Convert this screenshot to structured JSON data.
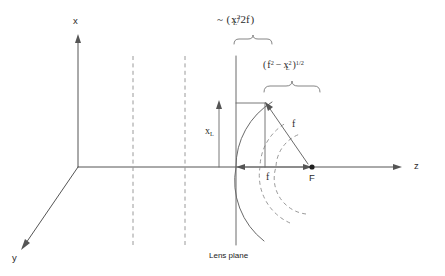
{
  "figure": {
    "background_color": "#ffffff",
    "line_color": "#555555",
    "dashed_color": "#9a9a9a"
  },
  "axes": {
    "x_label": "x",
    "y_label": "y",
    "z_label": "z",
    "origin_label": ""
  },
  "labels": {
    "lens_plane": "Lens plane",
    "focal_point": "F",
    "x_l_symbol": "x",
    "x_l_subscript": "L",
    "focal_length_axis": "f",
    "focal_length_ray": "f"
  },
  "annotations": {
    "top_formula": {
      "tilde": "~",
      "open_paren": "(",
      "numerator_base": "x",
      "numerator_sub": "L",
      "numerator_sup": "2",
      "slash": "/",
      "denominator": "2f",
      "close_paren": ")",
      "plain_text": "~ ( x_L^2 / 2f )"
    },
    "right_formula": {
      "open_paren": "(",
      "term1_base": "f",
      "term1_sup": "2",
      "minus": "−",
      "term2_base": "x",
      "term2_sub": "L",
      "term2_sup": "2",
      "close_paren": ")",
      "exponent": "1/2",
      "plain_text": "( f^2 - x_L^2 )^(1/2)"
    }
  },
  "geometry": {
    "origin": {
      "x": 78,
      "y": 167
    },
    "z_axis_end": {
      "x": 400,
      "y": 167
    },
    "x_axis_top": {
      "x": 78,
      "y": 34
    },
    "y_axis_end": {
      "x": 20,
      "y": 248
    },
    "lens_plane_x": 236,
    "dashed_plane_1_x": 133,
    "dashed_plane_2_x": 185,
    "plane_top_y": 55,
    "plane_bottom_y": 245,
    "focal_point": {
      "x": 312,
      "y": 167
    },
    "arc_point": {
      "x": 265,
      "y": 103
    },
    "arc_radius": 76,
    "x_l_height": 64
  }
}
